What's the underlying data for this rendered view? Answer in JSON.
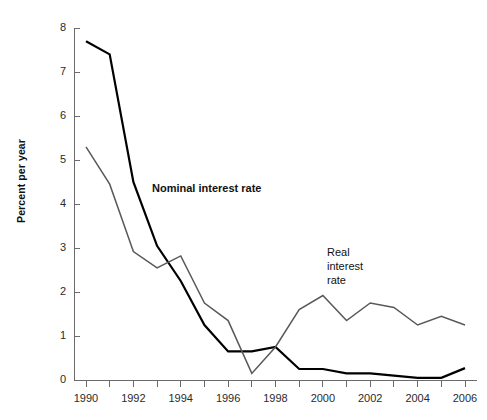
{
  "chart_data": {
    "type": "line",
    "title": "",
    "xlabel": "",
    "ylabel": "Percent per year",
    "xlim": [
      1990,
      2006
    ],
    "ylim": [
      0,
      8
    ],
    "grid": false,
    "legend_position": "inline-annotations",
    "x": [
      1990,
      1991,
      1992,
      1993,
      1994,
      1995,
      1996,
      1997,
      1998,
      1999,
      2000,
      2001,
      2002,
      2003,
      2004,
      2005,
      2006
    ],
    "y_ticks": [
      0,
      1,
      2,
      3,
      4,
      5,
      6,
      7,
      8
    ],
    "y_tick_labels": [
      "0",
      "1",
      "2",
      "3",
      "4",
      "5",
      "6",
      "7",
      "8"
    ],
    "x_ticks": [
      1990,
      1991,
      1992,
      1993,
      1994,
      1995,
      1996,
      1997,
      1998,
      1999,
      2000,
      2001,
      2002,
      2003,
      2004,
      2005,
      2006
    ],
    "x_tick_labels": [
      "1990",
      "",
      "1992",
      "",
      "1994",
      "",
      "1996",
      "",
      "1998",
      "",
      "2000",
      "",
      "2002",
      "",
      "2004",
      "",
      "2006"
    ],
    "x_tick_labels_shown": [
      "1990",
      "1992",
      "1994",
      "1996",
      "1998",
      "2000",
      "2002",
      "2004",
      "2006"
    ],
    "series": [
      {
        "name": "Nominal interest rate",
        "color": "#000000",
        "width": 2.2,
        "values": [
          7.7,
          7.4,
          4.5,
          3.05,
          2.25,
          1.25,
          0.65,
          0.65,
          0.75,
          0.25,
          0.25,
          0.15,
          0.15,
          0.1,
          0.05,
          0.05,
          0.27
        ]
      },
      {
        "name": "Real interest rate",
        "color": "#595959",
        "width": 1.5,
        "values": [
          5.3,
          4.45,
          2.92,
          2.55,
          2.82,
          1.75,
          1.35,
          0.15,
          0.75,
          1.6,
          1.92,
          1.35,
          1.75,
          1.65,
          1.25,
          1.45,
          1.25
        ]
      }
    ],
    "annotations": [
      {
        "text": "Nominal interest rate",
        "x_px": 152,
        "y_px": 188,
        "bold": true
      },
      {
        "text_lines": [
          "Real",
          "interest",
          "rate"
        ],
        "x_px": 327,
        "y_px": 251,
        "bold": false
      }
    ]
  },
  "labels": {
    "y_axis_title": "Percent per year",
    "nominal_series": "Nominal interest rate",
    "real_line1": "Real",
    "real_line2": "interest",
    "real_line3": "rate"
  },
  "colors": {
    "nominal": "#000000",
    "real": "#595959",
    "axis": "#6b6b6b",
    "text": "#1a1a1a",
    "background": "#ffffff"
  }
}
